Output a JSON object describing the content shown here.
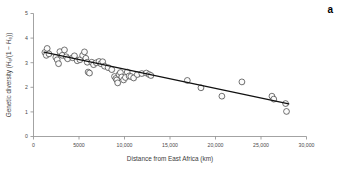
{
  "figure": {
    "panel_label": "a",
    "background_color": "#ffffff",
    "marker_fill": "#fbfbfb",
    "marker_stroke": "#242424",
    "line_color": "#111111",
    "axis_color": "#8c8c8c"
  },
  "chart_data": {
    "type": "scatter",
    "title": "",
    "subtitle": "",
    "xlabel": "Distance from East Africa (km)",
    "ylabel": "Genetic diversity (He/(1 − He))",
    "xlim": [
      0,
      30000
    ],
    "ylim": [
      0,
      5
    ],
    "xticks": [
      0,
      5000,
      10000,
      15000,
      20000,
      25000,
      30000
    ],
    "xtick_labels": [
      "0",
      "5000",
      "10,000",
      "15,000",
      "20,000",
      "25,000",
      "30,000"
    ],
    "yticks": [
      0,
      1,
      2,
      3,
      4,
      5
    ],
    "ytick_labels": [
      "0",
      "1",
      "2",
      "3",
      "4",
      "5"
    ],
    "grid": false,
    "legend": false,
    "legend_position": "none",
    "marker_style": "open-circle",
    "series": [
      {
        "name": "Populations",
        "points": [
          [
            1250,
            3.42
          ],
          [
            1400,
            3.3
          ],
          [
            1500,
            3.58
          ],
          [
            1700,
            3.36
          ],
          [
            2450,
            3.22
          ],
          [
            2600,
            3.12
          ],
          [
            2750,
            2.96
          ],
          [
            2900,
            3.45
          ],
          [
            3150,
            3.3
          ],
          [
            3400,
            3.52
          ],
          [
            3600,
            3.24
          ],
          [
            3750,
            3.16
          ],
          [
            4300,
            3.2
          ],
          [
            4500,
            3.28
          ],
          [
            4800,
            3.08
          ],
          [
            5100,
            3.12
          ],
          [
            5400,
            3.3
          ],
          [
            5600,
            3.44
          ],
          [
            5750,
            3.18
          ],
          [
            5900,
            3.02
          ],
          [
            6000,
            2.62
          ],
          [
            6150,
            2.58
          ],
          [
            6400,
            3.02
          ],
          [
            6600,
            2.92
          ],
          [
            6900,
            3.0
          ],
          [
            7200,
            3.05
          ],
          [
            7400,
            2.96
          ],
          [
            7600,
            3.04
          ],
          [
            7800,
            2.86
          ],
          [
            8200,
            2.8
          ],
          [
            8600,
            2.72
          ],
          [
            8900,
            2.44
          ],
          [
            9050,
            2.36
          ],
          [
            9150,
            2.3
          ],
          [
            9250,
            2.18
          ],
          [
            9400,
            2.52
          ],
          [
            9550,
            2.6
          ],
          [
            9700,
            2.42
          ],
          [
            9900,
            2.3
          ],
          [
            10100,
            2.4
          ],
          [
            10300,
            2.62
          ],
          [
            10500,
            2.46
          ],
          [
            10700,
            2.44
          ],
          [
            11000,
            2.38
          ],
          [
            11400,
            2.52
          ],
          [
            11900,
            2.56
          ],
          [
            12400,
            2.58
          ],
          [
            12700,
            2.52
          ],
          [
            12900,
            2.48
          ],
          [
            16900,
            2.28
          ],
          [
            18400,
            1.98
          ],
          [
            20700,
            1.64
          ],
          [
            22900,
            2.22
          ],
          [
            26200,
            1.64
          ],
          [
            26400,
            1.52
          ],
          [
            27700,
            1.34
          ],
          [
            27800,
            1.02
          ]
        ]
      }
    ],
    "trendline": {
      "type": "linear-fit",
      "x_start": 1150,
      "y_start": 3.43,
      "x_end": 28050,
      "y_end": 1.33
    }
  }
}
